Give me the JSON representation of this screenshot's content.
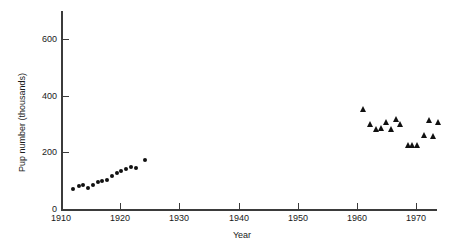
{
  "chart_data": {
    "type": "scatter",
    "title": "",
    "xlabel": "Year",
    "ylabel": "Pup number (thousands)",
    "xlim": [
      1910,
      1974
    ],
    "ylim": [
      0,
      700
    ],
    "xticks": [
      1910,
      1920,
      1930,
      1940,
      1950,
      1960,
      1970
    ],
    "xtick_labels": [
      "1910",
      "1920",
      "1930",
      "1940",
      "1950",
      "1960",
      "1970"
    ],
    "yticks": [
      0,
      200,
      400,
      600
    ],
    "ytick_labels": [
      "0",
      "200",
      "400",
      "600"
    ],
    "grid": false,
    "legend": null,
    "marker_color": "#111111",
    "axis_color": "#3b3b3b",
    "series": [
      {
        "name": "Early period (circles)",
        "marker": "circle",
        "points": [
          {
            "x": 1912.0,
            "y": 72
          },
          {
            "x": 1913.0,
            "y": 82
          },
          {
            "x": 1913.8,
            "y": 84
          },
          {
            "x": 1914.6,
            "y": 75
          },
          {
            "x": 1915.4,
            "y": 86
          },
          {
            "x": 1916.2,
            "y": 95
          },
          {
            "x": 1917.0,
            "y": 99
          },
          {
            "x": 1917.8,
            "y": 104
          },
          {
            "x": 1918.6,
            "y": 115
          },
          {
            "x": 1919.4,
            "y": 126
          },
          {
            "x": 1920.2,
            "y": 136
          },
          {
            "x": 1921.0,
            "y": 142
          },
          {
            "x": 1921.8,
            "y": 150
          },
          {
            "x": 1922.6,
            "y": 146
          },
          {
            "x": 1924.2,
            "y": 172
          }
        ]
      },
      {
        "name": "Later period (triangles)",
        "marker": "triangle",
        "points": [
          {
            "x": 1961.0,
            "y": 352
          },
          {
            "x": 1962.3,
            "y": 300
          },
          {
            "x": 1963.2,
            "y": 282
          },
          {
            "x": 1964.2,
            "y": 288
          },
          {
            "x": 1965.0,
            "y": 308
          },
          {
            "x": 1965.8,
            "y": 282
          },
          {
            "x": 1966.6,
            "y": 318
          },
          {
            "x": 1967.4,
            "y": 300
          },
          {
            "x": 1968.6,
            "y": 228
          },
          {
            "x": 1969.4,
            "y": 228
          },
          {
            "x": 1970.2,
            "y": 226
          },
          {
            "x": 1971.4,
            "y": 262
          },
          {
            "x": 1972.3,
            "y": 316
          },
          {
            "x": 1972.9,
            "y": 258
          },
          {
            "x": 1973.8,
            "y": 308
          }
        ]
      }
    ]
  }
}
